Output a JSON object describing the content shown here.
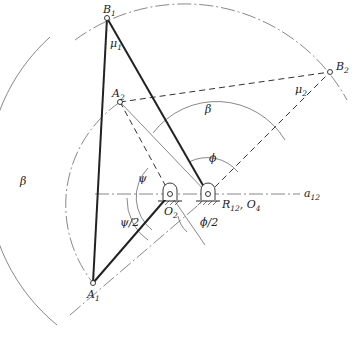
{
  "diagram": {
    "type": "four-bar linkage synthesis (two-position)",
    "points": {
      "B1": {
        "label": "B",
        "sub": "1"
      },
      "B2": {
        "label": "B",
        "sub": "2"
      },
      "A1": {
        "label": "A",
        "sub": "1"
      },
      "A2": {
        "label": "A",
        "sub": "2"
      },
      "O2": {
        "label": "O",
        "sub": "2"
      },
      "R12": {
        "label": "R",
        "sub": "12",
        "suffix": ", O",
        "suffix_sub": "4"
      }
    },
    "axis": {
      "label": "a",
      "sub": "12"
    },
    "angles": {
      "mu1": {
        "label": "μ",
        "sub": "1"
      },
      "mu2": {
        "label": "μ",
        "sub": "2"
      },
      "beta_upper": "β",
      "beta_left": "β",
      "phi": "ϕ",
      "phi_half": "ϕ/2",
      "psi": "ψ",
      "psi_half": "ψ/2"
    }
  }
}
